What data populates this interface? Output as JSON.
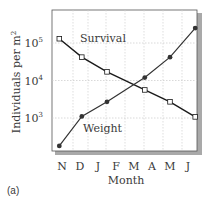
{
  "chart_data": {
    "type": "line",
    "title": "",
    "panel_label": "(a)",
    "xlabel": "Month",
    "ylabel": "Individuals per m",
    "ylabel_superscript": "2",
    "yscale": "log",
    "ylim": [
      140,
      200000
    ],
    "xlim": [
      -0.3,
      7.5
    ],
    "categories": [
      "N",
      "D",
      "J",
      "F",
      "M",
      "A",
      "M",
      "J"
    ],
    "yticks": [
      {
        "value": 100000,
        "base": "10",
        "exp": "5"
      },
      {
        "value": 10000,
        "base": "10",
        "exp": "4"
      },
      {
        "value": 1000,
        "base": "10",
        "exp": "3"
      }
    ],
    "grid": true,
    "series": [
      {
        "name": "Survival",
        "marker": "open-square",
        "color": "#1a1a1a",
        "x": [
          -0.15,
          1.1,
          2.5,
          4.6,
          6.0,
          7.4
        ],
        "values": [
          130000,
          42000,
          17000,
          5600,
          2700,
          1070
        ]
      },
      {
        "name": "Weight",
        "marker": "filled-circle",
        "color": "#333333",
        "x": [
          -0.15,
          1.1,
          2.5,
          4.6,
          6.0,
          7.4
        ],
        "values": [
          180,
          1100,
          2700,
          12000,
          42000,
          250000
        ]
      }
    ]
  }
}
